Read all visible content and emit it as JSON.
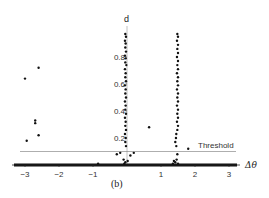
{
  "chart_data": {
    "type": "scatter",
    "title": "",
    "caption": "(b)",
    "xlabel": "Δθ",
    "ylabel": "d",
    "xlim": [
      -3.2,
      3.2
    ],
    "ylim": [
      0,
      1.0
    ],
    "x_ticks": [
      -3,
      -2,
      -1,
      1,
      2,
      3
    ],
    "x_tick_labels": [
      "−3",
      "−2",
      "−1",
      "1",
      "2",
      "3"
    ],
    "y_ticks": [
      0.2,
      0.4,
      0.6,
      0.8
    ],
    "y_tick_labels": [
      "0.2",
      "0.4",
      "0.6",
      "0.8"
    ],
    "grid": false,
    "legend": null,
    "threshold": {
      "label": "Threshold",
      "value": 0.1
    },
    "series": [
      {
        "name": "isolated points",
        "points": [
          [
            -3.0,
            0.64
          ],
          [
            -2.6,
            0.72
          ],
          [
            -2.7,
            0.33
          ],
          [
            -2.7,
            0.31
          ],
          [
            -2.6,
            0.22
          ],
          [
            -2.95,
            0.18
          ],
          [
            0.65,
            0.28
          ],
          [
            1.8,
            0.12
          ],
          [
            -0.85,
            0.01
          ]
        ]
      },
      {
        "name": "cluster near 0",
        "points": [
          [
            -0.05,
            0.97
          ],
          [
            -0.03,
            0.95
          ],
          [
            -0.06,
            0.92
          ],
          [
            -0.04,
            0.9
          ],
          [
            -0.05,
            0.87
          ],
          [
            -0.03,
            0.84
          ],
          [
            -0.06,
            0.81
          ],
          [
            -0.04,
            0.79
          ],
          [
            -0.05,
            0.76
          ],
          [
            -0.02,
            0.74
          ],
          [
            -0.06,
            0.71
          ],
          [
            -0.04,
            0.68
          ],
          [
            -0.05,
            0.65
          ],
          [
            -0.03,
            0.62
          ],
          [
            -0.06,
            0.59
          ],
          [
            -0.04,
            0.56
          ],
          [
            -0.05,
            0.53
          ],
          [
            -0.03,
            0.5
          ],
          [
            -0.06,
            0.47
          ],
          [
            -0.04,
            0.44
          ],
          [
            -0.05,
            0.41
          ],
          [
            -0.03,
            0.38
          ],
          [
            -0.06,
            0.35
          ],
          [
            -0.04,
            0.32
          ],
          [
            -0.05,
            0.29
          ],
          [
            -0.03,
            0.26
          ],
          [
            -0.06,
            0.23
          ],
          [
            -0.04,
            0.2
          ],
          [
            -0.05,
            0.17
          ],
          [
            -0.03,
            0.14
          ],
          [
            -0.3,
            0.08
          ],
          [
            -0.2,
            0.09
          ],
          [
            0.1,
            0.07
          ],
          [
            0.2,
            0.09
          ],
          [
            -0.1,
            0.04
          ],
          [
            -0.05,
            0.02
          ],
          [
            -0.08,
            0.01
          ],
          [
            0.02,
            0.03
          ]
        ]
      },
      {
        "name": "cluster near 1.5",
        "points": [
          [
            1.48,
            0.97
          ],
          [
            1.5,
            0.95
          ],
          [
            1.47,
            0.92
          ],
          [
            1.5,
            0.89
          ],
          [
            1.48,
            0.86
          ],
          [
            1.5,
            0.83
          ],
          [
            1.47,
            0.8
          ],
          [
            1.5,
            0.77
          ],
          [
            1.48,
            0.74
          ],
          [
            1.5,
            0.71
          ],
          [
            1.47,
            0.68
          ],
          [
            1.5,
            0.65
          ],
          [
            1.48,
            0.62
          ],
          [
            1.5,
            0.59
          ],
          [
            1.47,
            0.56
          ],
          [
            1.5,
            0.53
          ],
          [
            1.48,
            0.5
          ],
          [
            1.5,
            0.47
          ],
          [
            1.47,
            0.44
          ],
          [
            1.5,
            0.41
          ],
          [
            1.48,
            0.38
          ],
          [
            1.5,
            0.35
          ],
          [
            1.47,
            0.32
          ],
          [
            1.5,
            0.29
          ],
          [
            1.48,
            0.26
          ],
          [
            1.45,
            0.23
          ],
          [
            1.44,
            0.2
          ],
          [
            1.42,
            0.17
          ],
          [
            1.45,
            0.14
          ],
          [
            1.48,
            0.08
          ],
          [
            1.38,
            0.03
          ],
          [
            1.42,
            0.02
          ],
          [
            1.46,
            0.04
          ],
          [
            1.5,
            0.01
          ],
          [
            1.35,
            0.01
          ]
        ]
      }
    ]
  }
}
